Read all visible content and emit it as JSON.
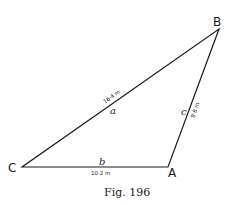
{
  "figure": {
    "caption": "Fig. 196",
    "vertices": {
      "A": {
        "label": "A"
      },
      "B": {
        "label": "B"
      },
      "C": {
        "label": "C"
      }
    },
    "sides": {
      "a": {
        "letter": "a",
        "length": "16·4 m",
        "between": "C-B"
      },
      "b": {
        "letter": "b",
        "length": "10·2 m",
        "between": "C-A"
      },
      "c": {
        "letter": "c",
        "length": "9·8 m",
        "between": "A-B"
      }
    },
    "colors": {
      "line": "#1a1a1a",
      "background": "#ffffff"
    }
  }
}
